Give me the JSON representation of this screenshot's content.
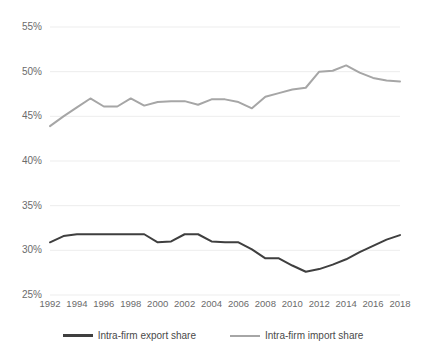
{
  "chart_data": {
    "type": "line",
    "title": "",
    "xlabel": "",
    "ylabel": "",
    "x": [
      1992,
      1993,
      1994,
      1995,
      1996,
      1997,
      1998,
      1999,
      2000,
      2001,
      2002,
      2003,
      2004,
      2005,
      2006,
      2007,
      2008,
      2009,
      2010,
      2011,
      2012,
      2013,
      2014,
      2015,
      2016,
      2017,
      2018
    ],
    "xlim": [
      1992,
      2018
    ],
    "ylim": [
      25,
      55
    ],
    "ytick_values": [
      25,
      30,
      35,
      40,
      45,
      50,
      55
    ],
    "ytick_labels": [
      "25%",
      "30%",
      "35%",
      "40%",
      "45%",
      "50%",
      "55%"
    ],
    "xtick_values": [
      1992,
      1994,
      1996,
      1998,
      2000,
      2002,
      2004,
      2006,
      2008,
      2010,
      2012,
      2014,
      2016,
      2018
    ],
    "xtick_labels": [
      "1992",
      "1994",
      "1996",
      "1998",
      "2000",
      "2002",
      "2004",
      "2006",
      "2008",
      "2010",
      "2012",
      "2014",
      "2016",
      "2018"
    ],
    "grid": "horizontal",
    "legend_position": "bottom",
    "series": [
      {
        "name": "Intra-firm export share",
        "color": "#3f3f3f",
        "values": [
          30.9,
          31.6,
          31.8,
          31.8,
          31.8,
          31.8,
          31.8,
          31.8,
          30.9,
          31.0,
          31.8,
          31.8,
          31.0,
          30.9,
          30.9,
          30.1,
          29.1,
          29.1,
          28.3,
          27.6,
          27.9,
          28.4,
          29.0,
          29.8,
          30.5,
          31.2,
          31.7
        ]
      },
      {
        "name": "Intra-firm import share",
        "color": "#a6a6a6",
        "values": [
          43.9,
          45.0,
          46.0,
          47.0,
          46.1,
          46.1,
          47.0,
          46.2,
          46.6,
          46.7,
          46.7,
          46.3,
          46.9,
          46.9,
          46.6,
          45.9,
          47.2,
          47.6,
          48.0,
          48.2,
          50.0,
          50.1,
          50.7,
          49.9,
          49.3,
          49.0,
          48.9
        ]
      }
    ]
  },
  "axis": {
    "ytick_labels": [
      "55%",
      "50%",
      "45%",
      "40%",
      "35%",
      "30%",
      "25%"
    ],
    "xtick_labels": [
      "1992",
      "1994",
      "1996",
      "1998",
      "2000",
      "2002",
      "2004",
      "2006",
      "2008",
      "2010",
      "2012",
      "2014",
      "2016",
      "2018"
    ]
  },
  "legend": {
    "items": [
      {
        "label": "Intra-firm export share",
        "color": "#3f3f3f"
      },
      {
        "label": "Intra-firm import share",
        "color": "#a6a6a6"
      }
    ]
  }
}
